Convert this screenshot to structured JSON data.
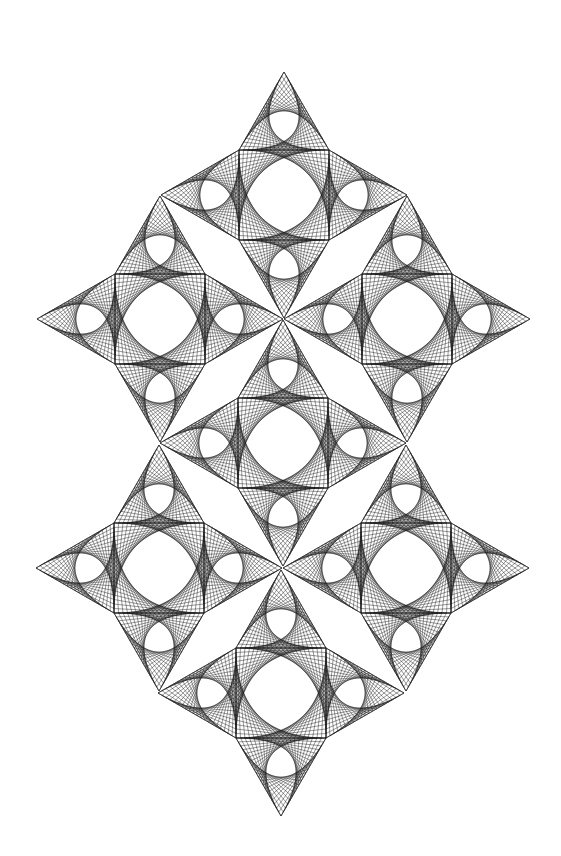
{
  "artwork": {
    "title": "String art star-and-square tessellation",
    "background": "#ffffff",
    "stroke_color": "#1a1a1a",
    "stroke_width": 0.45,
    "stitches_per_corner": 20,
    "square_half_size": 45,
    "tip_distance": 123,
    "modules": [
      {
        "name": "top",
        "cx": 284,
        "cy": 195
      },
      {
        "name": "upper-left",
        "cx": 160,
        "cy": 319
      },
      {
        "name": "upper-right",
        "cx": 407,
        "cy": 319
      },
      {
        "name": "center",
        "cx": 283,
        "cy": 443
      },
      {
        "name": "lower-left",
        "cx": 159,
        "cy": 568
      },
      {
        "name": "lower-right",
        "cx": 406,
        "cy": 568
      },
      {
        "name": "bottom",
        "cx": 281,
        "cy": 693
      }
    ]
  }
}
